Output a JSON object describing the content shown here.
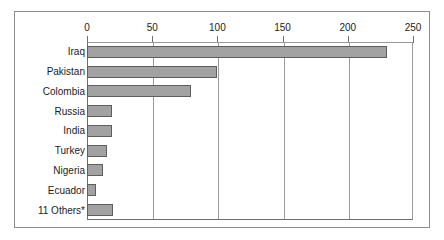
{
  "chart_data": {
    "type": "bar",
    "orientation": "horizontal",
    "title": "",
    "subtitle": "",
    "xlabel": "",
    "ylabel": "",
    "categories": [
      "Iraq",
      "Pakistan",
      "Colombia",
      "Russia",
      "India",
      "Turkey",
      "Nigeria",
      "Ecuador",
      "11 Others*"
    ],
    "values": [
      230,
      100,
      80,
      19,
      19,
      15,
      12,
      7,
      20
    ],
    "xlim": [
      0,
      250
    ],
    "xticks": [
      0,
      50,
      100,
      150,
      200,
      250
    ],
    "xtick_labels": [
      "0",
      "50",
      "100",
      "150",
      "200",
      "250"
    ],
    "gridlines": {
      "vertical": [
        50,
        100,
        150,
        200
      ],
      "horizontal": []
    },
    "legend": null,
    "legend_position": "none",
    "bar_color": "#a2a2a2",
    "bar_border_color": "#5e5e5e",
    "axis_color": "#6e6e6e",
    "grid_color": "#9a9a9a",
    "background": "#ffffff",
    "frame_border_color": "#8d8d8d"
  }
}
